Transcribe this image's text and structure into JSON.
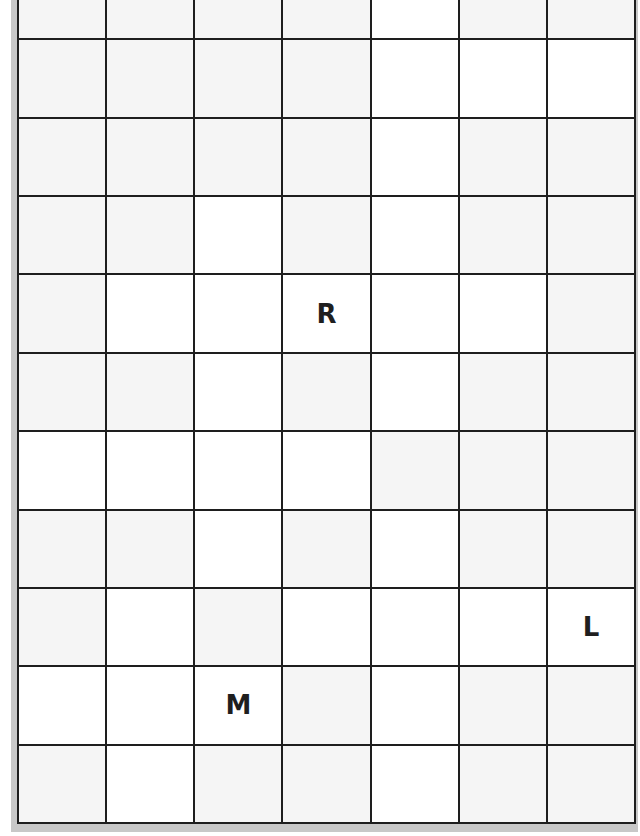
{
  "puzzle": {
    "columns": 7,
    "rows": 11,
    "line_color": "#1e1e1e",
    "shade_color": "#f5f5f5",
    "plain_color": "#ffffff",
    "grid": [
      [
        "g",
        "g",
        "g",
        "g",
        "w",
        "g",
        "g"
      ],
      [
        "g",
        "g",
        "g",
        "g",
        "w",
        "w",
        "w"
      ],
      [
        "g",
        "g",
        "g",
        "g",
        "w",
        "g",
        "g"
      ],
      [
        "g",
        "g",
        "w",
        "g",
        "w",
        "g",
        "g"
      ],
      [
        "g",
        "w",
        "w",
        "w",
        "w",
        "w",
        "g"
      ],
      [
        "g",
        "g",
        "w",
        "g",
        "w",
        "g",
        "g"
      ],
      [
        "w",
        "w",
        "w",
        "w",
        "g",
        "g",
        "g"
      ],
      [
        "g",
        "g",
        "w",
        "g",
        "w",
        "g",
        "g"
      ],
      [
        "g",
        "w",
        "g",
        "w",
        "w",
        "w",
        "w"
      ],
      [
        "w",
        "w",
        "w",
        "g",
        "w",
        "g",
        "g"
      ],
      [
        "g",
        "w",
        "g",
        "g",
        "w",
        "g",
        "g"
      ]
    ],
    "letters": [
      {
        "row": 4,
        "col": 3,
        "char": "R"
      },
      {
        "row": 8,
        "col": 6,
        "char": "L"
      },
      {
        "row": 9,
        "col": 2,
        "char": "M"
      }
    ]
  }
}
